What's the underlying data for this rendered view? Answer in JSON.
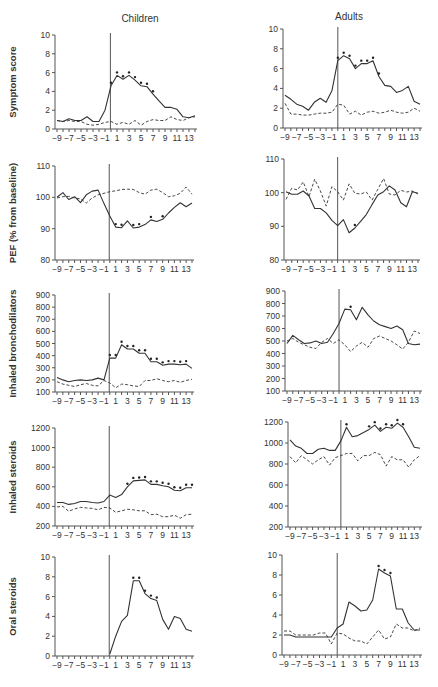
{
  "columns": [
    "Children",
    "Adults"
  ],
  "x_ticks": [
    -9,
    -7,
    -5,
    -3,
    -1,
    1,
    3,
    5,
    7,
    9,
    11,
    13
  ],
  "chart_data": [
    {
      "type": "line",
      "panel": "children-symptom-score",
      "column": "Children",
      "ylabel": "Symptom score",
      "ylim": [
        0,
        10
      ],
      "yticks": [
        0,
        2,
        4,
        6,
        8,
        10
      ],
      "x": [
        -9,
        -8,
        -7,
        -6,
        -5,
        -4,
        -3,
        -2,
        -1,
        0,
        1,
        2,
        3,
        4,
        5,
        6,
        7,
        8,
        9,
        10,
        11,
        12,
        13,
        14
      ],
      "series": [
        {
          "name": "solid",
          "style": "solid",
          "values": [
            0.9,
            0.8,
            1.1,
            0.9,
            0.9,
            1.3,
            0.8,
            0.8,
            2.0,
            4.6,
            5.7,
            5.3,
            5.7,
            5.2,
            4.6,
            4.5,
            3.7,
            3.0,
            2.3,
            2.3,
            2.1,
            1.3,
            1.2,
            1.4
          ]
        },
        {
          "name": "dashed",
          "style": "dashed",
          "values": [
            0.9,
            0.8,
            0.9,
            0.8,
            0.8,
            0.5,
            0.4,
            0.5,
            0.7,
            0.8,
            0.5,
            0.7,
            0.5,
            0.9,
            0.4,
            0.8,
            1.0,
            0.9,
            0.9,
            1.3,
            1.0,
            0.9,
            1.2,
            1.3
          ]
        }
      ],
      "significant_marks": [
        0,
        1,
        2,
        3,
        4,
        5,
        6,
        7
      ],
      "event_line_x": -0.1
    },
    {
      "type": "line",
      "panel": "adults-symptom-score",
      "column": "Adults",
      "ylabel": "",
      "ylim": [
        0,
        10
      ],
      "yticks": [
        0,
        2,
        4,
        6,
        8,
        10
      ],
      "x": [
        -9,
        -8,
        -7,
        -6,
        -5,
        -4,
        -3,
        -2,
        -1,
        0,
        1,
        2,
        3,
        4,
        5,
        6,
        7,
        8,
        9,
        10,
        11,
        12,
        13,
        14
      ],
      "series": [
        {
          "name": "solid",
          "style": "solid",
          "values": [
            3.3,
            2.9,
            2.4,
            2.2,
            1.8,
            2.6,
            3.0,
            2.6,
            3.8,
            6.8,
            7.3,
            7.0,
            6.0,
            6.5,
            6.5,
            6.8,
            5.2,
            4.3,
            4.2,
            3.6,
            3.8,
            4.2,
            2.7,
            2.4
          ]
        },
        {
          "name": "dashed",
          "style": "dashed",
          "values": [
            2.5,
            1.4,
            1.4,
            1.3,
            1.3,
            1.4,
            1.5,
            1.5,
            1.6,
            2.4,
            2.3,
            1.4,
            1.7,
            1.3,
            1.6,
            1.7,
            1.5,
            1.6,
            1.8,
            1.6,
            1.5,
            1.6,
            2.0,
            1.7
          ]
        }
      ],
      "significant_marks": [
        0,
        1,
        2,
        3,
        4,
        5,
        6,
        7
      ],
      "event_line_x": 0
    },
    {
      "type": "line",
      "panel": "children-pef",
      "column": "Children",
      "ylabel": "PEF (% from baseline)",
      "ylim": [
        80,
        110
      ],
      "yticks": [
        80,
        90,
        100,
        110
      ],
      "x": [
        -9,
        -8,
        -7,
        -6,
        -5,
        -4,
        -3,
        -2,
        -1,
        0,
        1,
        2,
        3,
        4,
        5,
        6,
        7,
        8,
        9,
        10,
        11,
        12,
        13,
        14
      ],
      "series": [
        {
          "name": "solid",
          "style": "solid",
          "values": [
            100,
            101.5,
            99.3,
            100.2,
            98.3,
            100.8,
            102,
            102.3,
            98,
            94,
            90.5,
            90.3,
            92.5,
            90.2,
            90.5,
            91.3,
            92.8,
            92.3,
            93,
            95,
            96.8,
            98.3,
            97,
            98.2
          ]
        },
        {
          "name": "dashed",
          "style": "dashed",
          "values": [
            99.8,
            100.2,
            100.3,
            99.8,
            99.5,
            98.2,
            99.8,
            100.8,
            101.3,
            101.8,
            102.1,
            102.5,
            102.6,
            102.5,
            101.5,
            101,
            102.3,
            102.6,
            101.5,
            100.2,
            100.5,
            101.3,
            103.3,
            101
          ]
        }
      ],
      "significant_marks": [
        1,
        2,
        4,
        5,
        7,
        9
      ],
      "event_line_x": -0.1
    },
    {
      "type": "line",
      "panel": "adults-pef",
      "column": "Adults",
      "ylabel": "",
      "ylim": [
        80,
        110
      ],
      "yticks": [
        80,
        90,
        100,
        110
      ],
      "x": [
        -9,
        -8,
        -7,
        -6,
        -5,
        -4,
        -3,
        -2,
        -1,
        0,
        1,
        2,
        3,
        4,
        5,
        6,
        7,
        8,
        9,
        10,
        11,
        12,
        13,
        14
      ],
      "series": [
        {
          "name": "solid",
          "style": "solid",
          "values": [
            100.3,
            99.5,
            99.5,
            100.5,
            99,
            95.3,
            95.3,
            94,
            91.8,
            90.2,
            92,
            88.1,
            89.5,
            91.5,
            93.5,
            96.5,
            99.3,
            100.3,
            102,
            100.8,
            97,
            95.8,
            100.3,
            99.8
          ]
        },
        {
          "name": "dashed",
          "style": "dashed",
          "values": [
            98,
            101.3,
            100.8,
            103.2,
            98.8,
            104,
            100.5,
            96,
            101.8,
            100.3,
            97.8,
            102.6,
            99.8,
            99.6,
            100.2,
            97.8,
            101,
            104.2,
            99.6,
            99.3,
            100.7,
            100.2,
            100.5,
            99.6
          ]
        }
      ],
      "significant_marks": [
        3
      ],
      "event_line_x": 0
    },
    {
      "type": "line",
      "panel": "children-inhaled-bronchodilators",
      "column": "Children",
      "ylabel": "Inhaled bronchodilators",
      "ylim": [
        100,
        900
      ],
      "yticks": [
        100,
        200,
        300,
        400,
        500,
        600,
        700,
        800,
        900
      ],
      "x": [
        -9,
        -8,
        -7,
        -6,
        -5,
        -4,
        -3,
        -2,
        -1,
        0,
        1,
        2,
        3,
        4,
        5,
        6,
        7,
        8,
        9,
        10,
        11,
        12,
        13,
        14
      ],
      "series": [
        {
          "name": "solid",
          "style": "solid",
          "values": [
            220,
            200,
            185,
            195,
            200,
            195,
            200,
            215,
            200,
            380,
            380,
            490,
            455,
            455,
            420,
            420,
            350,
            350,
            320,
            330,
            330,
            325,
            330,
            295
          ]
        },
        {
          "name": "dashed",
          "style": "dashed",
          "values": [
            185,
            165,
            155,
            145,
            160,
            170,
            155,
            150,
            195,
            175,
            135,
            165,
            160,
            150,
            145,
            195,
            195,
            210,
            195,
            185,
            195,
            180,
            195,
            205
          ]
        }
      ],
      "significant_marks": [
        0,
        1,
        2,
        3,
        4,
        5,
        6,
        7,
        8,
        9,
        10,
        11,
        12,
        13
      ],
      "event_line_x": -0.1
    },
    {
      "type": "line",
      "panel": "adults-inhaled-bronchodilators",
      "column": "Adults",
      "ylabel": "",
      "ylim": [
        100,
        900
      ],
      "yticks": [
        100,
        200,
        300,
        400,
        500,
        600,
        700,
        800,
        900
      ],
      "x": [
        -9,
        -8,
        -7,
        -6,
        -5,
        -4,
        -3,
        -2,
        -1,
        0,
        1,
        2,
        3,
        4,
        5,
        6,
        7,
        8,
        9,
        10,
        11,
        12,
        13,
        14
      ],
      "series": [
        {
          "name": "solid",
          "style": "solid",
          "values": [
            480,
            545,
            510,
            480,
            485,
            500,
            480,
            490,
            560,
            640,
            755,
            750,
            670,
            770,
            710,
            660,
            630,
            615,
            600,
            620,
            590,
            480,
            470,
            475
          ]
        },
        {
          "name": "dashed",
          "style": "dashed",
          "values": [
            500,
            520,
            490,
            470,
            450,
            440,
            490,
            520,
            480,
            510,
            470,
            415,
            460,
            490,
            450,
            520,
            540,
            520,
            500,
            470,
            435,
            490,
            580,
            560
          ]
        }
      ],
      "significant_marks": [
        2
      ],
      "event_line_x": 0
    },
    {
      "type": "line",
      "panel": "children-inhaled-steroids",
      "column": "Children",
      "ylabel": "Inhaled steroids",
      "ylim": [
        200,
        1200
      ],
      "yticks": [
        200,
        400,
        600,
        800,
        1000,
        1200
      ],
      "x": [
        -9,
        -8,
        -7,
        -6,
        -5,
        -4,
        -3,
        -2,
        -1,
        0,
        1,
        2,
        3,
        4,
        5,
        6,
        7,
        8,
        9,
        10,
        11,
        12,
        13,
        14
      ],
      "series": [
        {
          "name": "solid",
          "style": "solid",
          "values": [
            440,
            440,
            420,
            430,
            450,
            450,
            440,
            435,
            450,
            515,
            490,
            520,
            600,
            660,
            665,
            670,
            625,
            625,
            610,
            600,
            565,
            560,
            590,
            590
          ]
        },
        {
          "name": "dashed",
          "style": "dashed",
          "values": [
            395,
            400,
            350,
            375,
            390,
            385,
            380,
            365,
            390,
            385,
            340,
            355,
            370,
            365,
            355,
            355,
            315,
            320,
            295,
            295,
            310,
            280,
            315,
            320
          ]
        }
      ],
      "significant_marks": [
        3,
        4,
        5,
        6,
        7,
        8,
        9,
        10,
        11,
        12,
        13,
        14
      ],
      "event_line_x": -0.1
    },
    {
      "type": "line",
      "panel": "adults-inhaled-steroids",
      "column": "Adults",
      "ylabel": "",
      "ylim": [
        200,
        1200
      ],
      "yticks": [
        200,
        400,
        600,
        800,
        1000,
        1200
      ],
      "x": [
        -9,
        -8,
        -7,
        -6,
        -5,
        -4,
        -3,
        -2,
        -1,
        0,
        1,
        2,
        3,
        4,
        5,
        6,
        7,
        8,
        9,
        10,
        11,
        12,
        13,
        14
      ],
      "series": [
        {
          "name": "solid",
          "style": "solid",
          "values": [
            1030,
            970,
            950,
            900,
            900,
            940,
            950,
            930,
            930,
            1020,
            1150,
            1060,
            1070,
            1100,
            1130,
            1170,
            1110,
            1150,
            1140,
            1190,
            1150,
            1060,
            960,
            950
          ]
        },
        {
          "name": "dashed",
          "style": "dashed",
          "values": [
            870,
            810,
            880,
            840,
            800,
            840,
            870,
            790,
            860,
            880,
            900,
            900,
            830,
            880,
            880,
            910,
            890,
            780,
            870,
            840,
            840,
            770,
            840,
            880
          ]
        }
      ],
      "significant_marks": [
        1,
        5,
        6,
        7,
        8,
        9,
        10,
        11
      ],
      "event_line_x": 0
    },
    {
      "type": "line",
      "panel": "children-oral-steroids",
      "column": "Children",
      "ylabel": "Oral steroids",
      "ylim": [
        0,
        10
      ],
      "yticks": [
        0,
        2,
        4,
        6,
        8,
        10
      ],
      "x": [
        0,
        1,
        2,
        3,
        4,
        5,
        6,
        7,
        8,
        9,
        10,
        11,
        12,
        13,
        14
      ],
      "series": [
        {
          "name": "solid",
          "style": "solid",
          "values": [
            0.2,
            2.0,
            3.5,
            4.1,
            7.6,
            7.6,
            6.3,
            5.8,
            5.6,
            3.7,
            2.7,
            4.0,
            3.8,
            2.7,
            2.5
          ]
        }
      ],
      "significant_marks": [
        4,
        5,
        6,
        7,
        8
      ],
      "event_line_x": -0.1
    },
    {
      "type": "line",
      "panel": "adults-oral-steroids",
      "column": "Adults",
      "ylabel": "",
      "ylim": [
        0,
        10
      ],
      "yticks": [
        0,
        2,
        4,
        6,
        8,
        10
      ],
      "x": [
        -9,
        -8,
        -7,
        -6,
        -5,
        -4,
        -3,
        -2,
        -1,
        0,
        1,
        2,
        3,
        4,
        5,
        6,
        7,
        8,
        9,
        10,
        11,
        12,
        13,
        14
      ],
      "series": [
        {
          "name": "solid",
          "style": "solid",
          "values": [
            2.0,
            2.0,
            1.8,
            1.8,
            1.8,
            1.8,
            1.8,
            1.8,
            1.8,
            2.7,
            3.1,
            5.3,
            4.9,
            4.4,
            4.5,
            5.5,
            8.6,
            8.2,
            7.9,
            4.6,
            4.6,
            3.2,
            2.5,
            2.5
          ]
        },
        {
          "name": "dashed",
          "style": "dashed",
          "values": [
            2.4,
            2.4,
            2.0,
            2.0,
            2.0,
            2.0,
            2.2,
            2.2,
            1.1,
            2.2,
            2.1,
            1.7,
            1.4,
            1.4,
            1.1,
            1.8,
            2.5,
            1.6,
            1.8,
            3.1,
            2.7,
            2.7,
            2.4,
            2.7
          ]
        }
      ],
      "significant_marks": [
        7,
        8,
        9
      ],
      "event_line_x": 0
    }
  ]
}
